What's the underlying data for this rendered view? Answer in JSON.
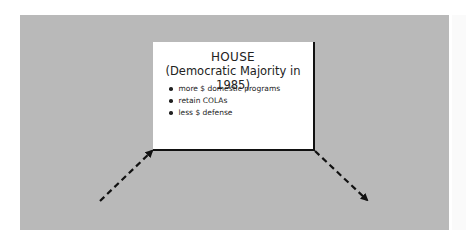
{
  "diagram": {
    "box": {
      "title": "HOUSE",
      "subtitle": "(Democratic Majority in 1985)",
      "bullets": [
        "more $ domestic programs",
        "retain COLAs",
        "less $ defense"
      ]
    },
    "arrows": [
      {
        "name": "arrow-left-into-box",
        "from": [
          100,
          201
        ],
        "to": [
          153,
          150
        ],
        "style": "dashed"
      },
      {
        "name": "arrow-right-out-of-box",
        "from": [
          314,
          150
        ],
        "to": [
          368,
          200
        ],
        "style": "dashed"
      }
    ],
    "colors": {
      "panel": "#b9b9b9",
      "box": "#ffffff",
      "ink": "#111111"
    }
  }
}
